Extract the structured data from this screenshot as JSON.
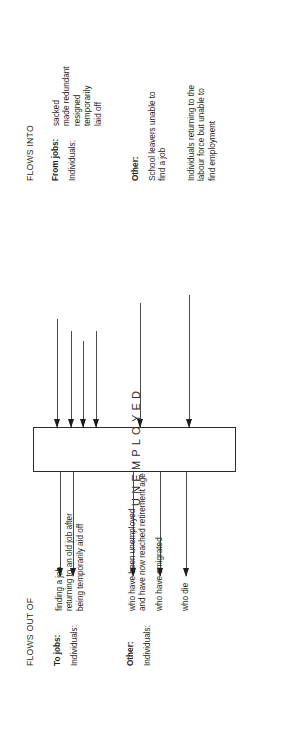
{
  "diagram": {
    "center_box": {
      "label": "UNEMPLOYED"
    },
    "flows_out": {
      "heading": "FLOWS OUT OF",
      "groups": [
        {
          "group_label": "To jobs:",
          "actor_label": "Individuals:",
          "items": [
            "finding a job",
            "returning to an old job after",
            "being temporarily  aid off"
          ],
          "arrow_count": 2
        },
        {
          "group_label": "Other:",
          "actor_label": "Individuals:",
          "items": [
            "who have been unemployed",
            "and have now reached retirement age",
            "who have emigrated",
            "who die"
          ],
          "arrow_count": 3
        }
      ]
    },
    "flows_into": {
      "heading": "FLOWS INTO",
      "groups": [
        {
          "group_label": "From jobs:",
          "actor_label": "Individuals:",
          "items": [
            "sacked",
            "made redundant",
            "resigned",
            "temporarily",
            "laid off"
          ],
          "arrow_count": 4
        },
        {
          "group_label": "Other:",
          "actor_label": "",
          "items": [
            "School leavers unable to",
            "find a job",
            "Individuals returning to the",
            "labour force but unable to",
            "find employment"
          ],
          "arrow_count": 2
        }
      ]
    },
    "colors": {
      "ink": "#231f20",
      "box_stroke": "#2b2b2b",
      "arrow": "#4a4a4a",
      "background": "#ffffff"
    }
  }
}
